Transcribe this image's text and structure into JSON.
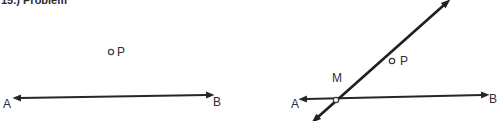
{
  "header": {
    "text": "15.) Problem"
  },
  "figures": [
    {
      "id": "figure-left",
      "name": "line-ab-with-external-point-p",
      "labels": {
        "A": "A",
        "B": "B",
        "P": "P"
      },
      "geometry": {
        "line_ab": {
          "x1": 20,
          "y1": 98,
          "x2": 207,
          "y2": 95,
          "arrows": "both"
        },
        "point_p": {
          "cx": 111,
          "cy": 52,
          "r": 2.6,
          "filled": false
        }
      }
    },
    {
      "id": "figure-right",
      "name": "line-ab-with-transversal-through-m-and-p",
      "labels": {
        "A": "A",
        "B": "B",
        "M": "M",
        "P": "P"
      },
      "geometry": {
        "line_ab": {
          "x1": 54,
          "y1": 99,
          "x2": 230,
          "y2": 95,
          "arrows": "both"
        },
        "line_mp": {
          "x1": 66,
          "y1": 117,
          "x2": 192,
          "y2": 5,
          "arrows": "both"
        },
        "point_m": {
          "cx": 84,
          "cy": 100,
          "r": 2.6,
          "filled": false
        },
        "point_p": {
          "cx": 140,
          "cy": 61,
          "r": 2.6,
          "filled": false
        }
      }
    }
  ],
  "colors": {
    "ink": "#2e2e2e",
    "stroke": "#262626",
    "background": "#ffffff"
  }
}
